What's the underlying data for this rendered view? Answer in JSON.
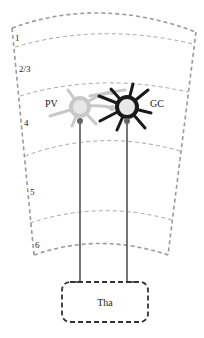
{
  "diagram": {
    "type": "cortical-layer-schematic",
    "layers": [
      {
        "label": "1"
      },
      {
        "label": "2/3"
      },
      {
        "label": "4"
      },
      {
        "label": "5"
      },
      {
        "label": "6"
      }
    ],
    "neurons": [
      {
        "label": "PV",
        "style": "light-gray",
        "color": "#c8c8c8"
      },
      {
        "label": "GC",
        "style": "black",
        "color": "#1a1a1a"
      }
    ],
    "thalamus": {
      "label": "Tha"
    },
    "colors": {
      "boundary": "#9a9a9a",
      "axon": "#666666",
      "pv": "#c8c8c8",
      "gc": "#1a1a1a"
    }
  }
}
